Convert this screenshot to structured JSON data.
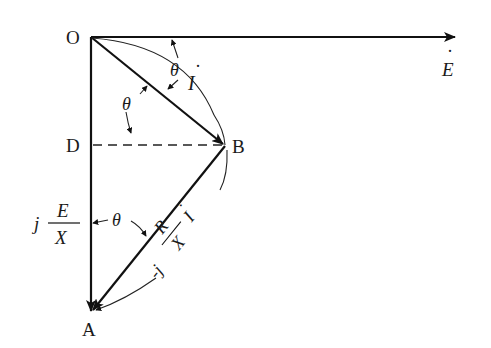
{
  "diagram": {
    "type": "phasor-diagram",
    "points": {
      "O": {
        "label": "O",
        "x": 91,
        "y": 37
      },
      "B": {
        "label": "B",
        "x": 225,
        "y": 145
      },
      "D": {
        "label": "D",
        "x": 91,
        "y": 145
      },
      "A": {
        "label": "A",
        "x": 91,
        "y": 313
      }
    },
    "vectors": {
      "E": {
        "label": "E",
        "dot": "·",
        "from": "O",
        "to_x": 455,
        "to_y": 37
      },
      "I": {
        "label": "I",
        "dot": "·",
        "from": "O",
        "to": "B"
      },
      "jE_over_X": {
        "prefix": "j",
        "numerator": "E",
        "denominator": "X",
        "from": "O",
        "to": "A"
      },
      "minus_jR_over_X_I": {
        "prefix": "-j",
        "numerator": "R",
        "denominator": "X",
        "suffix": "I",
        "dot": "·",
        "from": "B",
        "to": "A"
      }
    },
    "angles": {
      "theta_top": "θ",
      "theta_mid": "θ",
      "theta_bottom": "θ"
    },
    "dashed_line": {
      "from": "D",
      "to": "B"
    },
    "stroke_color": "#111111",
    "background": "#ffffff"
  }
}
